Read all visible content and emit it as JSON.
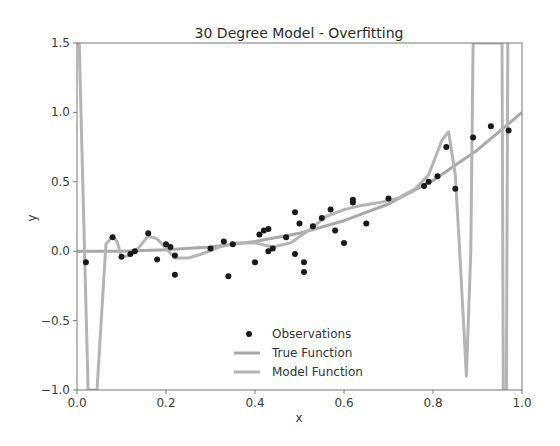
{
  "chart_data": {
    "type": "scatter",
    "title": "30 Degree Model - Overfitting",
    "xlabel": "x",
    "ylabel": "y",
    "xlim": [
      0.0,
      1.0
    ],
    "ylim": [
      -1.0,
      1.5
    ],
    "grid": false,
    "legend_position": "lower center",
    "x_ticks": [
      "0.0",
      "0.2",
      "0.4",
      "0.6",
      "0.8",
      "1.0"
    ],
    "y_ticks": [
      "-1.0",
      "-0.5",
      "0.0",
      "0.5",
      "1.0",
      "1.5"
    ],
    "legend": [
      "Observations",
      "True Function",
      "Model Function"
    ],
    "colors": {
      "observations": "#1a1a1a",
      "true_function": "#a8a8a8",
      "model_function": "#b4b4b4",
      "axes": "#555555"
    },
    "series": [
      {
        "name": "Observations",
        "type": "scatter",
        "points": [
          [
            0.02,
            -0.08
          ],
          [
            0.08,
            0.1
          ],
          [
            0.1,
            -0.04
          ],
          [
            0.12,
            -0.02
          ],
          [
            0.13,
            0.0
          ],
          [
            0.16,
            0.13
          ],
          [
            0.18,
            -0.06
          ],
          [
            0.2,
            0.05
          ],
          [
            0.21,
            0.03
          ],
          [
            0.22,
            -0.17
          ],
          [
            0.22,
            -0.03
          ],
          [
            0.3,
            0.02
          ],
          [
            0.33,
            0.07
          ],
          [
            0.34,
            -0.18
          ],
          [
            0.35,
            0.05
          ],
          [
            0.4,
            -0.08
          ],
          [
            0.41,
            0.12
          ],
          [
            0.42,
            0.15
          ],
          [
            0.43,
            0.16
          ],
          [
            0.43,
            0.0
          ],
          [
            0.44,
            0.02
          ],
          [
            0.47,
            0.1
          ],
          [
            0.49,
            0.28
          ],
          [
            0.49,
            -0.02
          ],
          [
            0.5,
            0.2
          ],
          [
            0.51,
            -0.15
          ],
          [
            0.51,
            -0.08
          ],
          [
            0.53,
            0.18
          ],
          [
            0.55,
            0.24
          ],
          [
            0.57,
            0.3
          ],
          [
            0.58,
            0.15
          ],
          [
            0.6,
            0.06
          ],
          [
            0.62,
            0.37
          ],
          [
            0.62,
            0.35
          ],
          [
            0.65,
            0.2
          ],
          [
            0.7,
            0.38
          ],
          [
            0.78,
            0.47
          ],
          [
            0.79,
            0.5
          ],
          [
            0.81,
            0.54
          ],
          [
            0.83,
            0.75
          ],
          [
            0.85,
            0.45
          ],
          [
            0.89,
            0.82
          ],
          [
            0.93,
            0.9
          ],
          [
            0.97,
            0.87
          ]
        ]
      },
      {
        "name": "True Function",
        "type": "line",
        "points": [
          [
            0.0,
            0.0
          ],
          [
            0.1,
            0.0
          ],
          [
            0.2,
            0.01
          ],
          [
            0.3,
            0.03
          ],
          [
            0.4,
            0.07
          ],
          [
            0.5,
            0.13
          ],
          [
            0.6,
            0.22
          ],
          [
            0.7,
            0.34
          ],
          [
            0.8,
            0.51
          ],
          [
            0.9,
            0.73
          ],
          [
            1.0,
            1.0
          ]
        ]
      },
      {
        "name": "Model Function",
        "type": "line",
        "points": [
          [
            0.0,
            1.5
          ],
          [
            0.005,
            1.5
          ],
          [
            0.025,
            -1.0
          ],
          [
            0.045,
            -1.0
          ],
          [
            0.065,
            0.05
          ],
          [
            0.08,
            0.11
          ],
          [
            0.09,
            0.07
          ],
          [
            0.1,
            -0.04
          ],
          [
            0.12,
            -0.03
          ],
          [
            0.14,
            0.03
          ],
          [
            0.16,
            0.11
          ],
          [
            0.18,
            0.09
          ],
          [
            0.2,
            0.02
          ],
          [
            0.22,
            -0.05
          ],
          [
            0.25,
            -0.05
          ],
          [
            0.28,
            -0.02
          ],
          [
            0.32,
            0.03
          ],
          [
            0.36,
            0.06
          ],
          [
            0.4,
            0.06
          ],
          [
            0.44,
            0.03
          ],
          [
            0.48,
            0.06
          ],
          [
            0.52,
            0.15
          ],
          [
            0.56,
            0.25
          ],
          [
            0.6,
            0.3
          ],
          [
            0.64,
            0.33
          ],
          [
            0.68,
            0.35
          ],
          [
            0.72,
            0.38
          ],
          [
            0.76,
            0.45
          ],
          [
            0.79,
            0.55
          ],
          [
            0.82,
            0.8
          ],
          [
            0.835,
            0.86
          ],
          [
            0.85,
            0.55
          ],
          [
            0.86,
            0.0
          ],
          [
            0.875,
            -0.9
          ],
          [
            0.885,
            0.0
          ],
          [
            0.89,
            1.5
          ],
          [
            0.955,
            1.5
          ],
          [
            0.958,
            -1.0
          ],
          [
            0.965,
            -1.0
          ],
          [
            0.968,
            1.5
          ]
        ]
      }
    ]
  }
}
